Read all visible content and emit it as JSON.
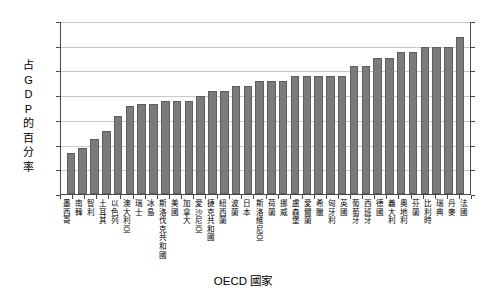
{
  "chart_data": {
    "type": "bar",
    "title": "",
    "xlabel": "OECD 國家",
    "ylabel": "占GDP的百分率",
    "ylabel_chars": [
      "占",
      "G",
      "D",
      "P",
      "的",
      "百",
      "分",
      "率"
    ],
    "ylim": [
      0,
      35
    ],
    "yticks": [
      0,
      5,
      10,
      15,
      20,
      25,
      30,
      35
    ],
    "ytick_labels": [
      "0",
      "5",
      "10",
      "15",
      "20",
      "25",
      "30",
      "35"
    ],
    "grid": true,
    "legend": "none",
    "bar_color": "#7b7b7b",
    "bar_edge_color": "#5e5e5e",
    "axis_color": "#4a4a4a",
    "grid_color": "#c9c9c9",
    "categories": [
      "墨西哥",
      "南韓",
      "智利",
      "土耳其",
      "以色列",
      "澳大利亞",
      "瑞士",
      "冰島",
      "斯洛伐克共和國",
      "美國",
      "加拿大",
      "愛沙尼亞",
      "捷克共和國",
      "紐西蘭",
      "波蘭",
      "日本",
      "斯洛維尼亞",
      "荷蘭",
      "挪威",
      "盧森堡",
      "愛爾蘭",
      "希臘",
      "匈牙利",
      "英國",
      "葡萄牙",
      "西班牙",
      "德國",
      "義大利",
      "奧地利",
      "芬蘭",
      "比利時",
      "瑞典",
      "丹麥",
      "法國"
    ],
    "values": [
      8.2,
      9.4,
      11.2,
      12.8,
      15.8,
      17.8,
      18.2,
      18.3,
      18.9,
      18.9,
      18.9,
      19.9,
      20.8,
      20.8,
      21.8,
      21.8,
      22.8,
      22.8,
      22.8,
      23.8,
      23.8,
      23.8,
      23.8,
      23.8,
      25.8,
      25.8,
      27.5,
      27.5,
      28.8,
      28.8,
      29.8,
      29.8,
      29.8,
      31.7
    ]
  }
}
